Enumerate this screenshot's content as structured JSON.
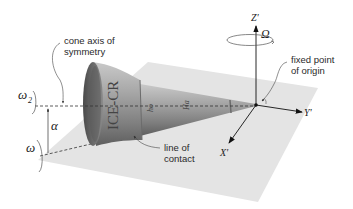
{
  "figure": {
    "type": "diagram",
    "colors": {
      "plane": "#e4e4e4",
      "cone_body": "#9a9a9a",
      "cone_dark": "#6e6e6e",
      "cone_light": "#c4c4c4",
      "line": "#222222",
      "dashed": "#333333"
    }
  },
  "labels": {
    "cone_axis_line1": "cone axis of",
    "cone_axis_line2": "symmetry",
    "fixed_point_line1": "fixed point",
    "fixed_point_line2": "of origin",
    "line_of_contact_line1": "line of",
    "line_of_contact_line2": "contact",
    "omega2": "ω",
    "omega2_sub": "2",
    "omega": "ω",
    "alpha": "α",
    "Omega": "Ω",
    "axis_z": "Z'",
    "axis_y": "Y'",
    "axis_x": "X'"
  },
  "cone": {
    "text_big": "ICE-CR",
    "text_small_1": "ho",
    "text_small_2": "Ha"
  }
}
